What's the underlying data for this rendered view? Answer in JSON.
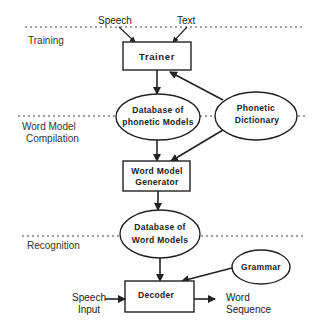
{
  "sections": [
    {
      "id": "training",
      "label": "Training"
    },
    {
      "id": "compilation",
      "lines": [
        "Word Model",
        "Compilation"
      ]
    },
    {
      "id": "recognition",
      "label": "Recognition"
    }
  ],
  "inputs": {
    "speech": "Speech",
    "text": "Text"
  },
  "nodes": {
    "trainer": {
      "label": "Trainer",
      "shape": "rectangle"
    },
    "phonetic_db": {
      "lines": [
        "Database of",
        "phonetic Models"
      ],
      "shape": "ellipse"
    },
    "phonetic_dict": {
      "lines": [
        "Phonetic",
        "Dictionary"
      ],
      "shape": "ellipse"
    },
    "generator": {
      "lines": [
        "Word Model",
        "Generator"
      ],
      "shape": "rectangle"
    },
    "word_db": {
      "lines": [
        "Database of",
        "Word Models"
      ],
      "shape": "ellipse"
    },
    "grammar": {
      "label": "Grammar",
      "shape": "ellipse"
    },
    "decoder": {
      "label": "Decoder",
      "shape": "rectangle"
    }
  },
  "io": {
    "speech_input": [
      "Speech",
      "Input"
    ],
    "word_sequence": [
      "Word",
      "Sequence"
    ]
  },
  "edges": [
    {
      "from": "Speech",
      "to": "Trainer"
    },
    {
      "from": "Text",
      "to": "Trainer"
    },
    {
      "from": "Trainer",
      "to": "Database of phonetic Models"
    },
    {
      "from": "Phonetic Dictionary",
      "to": "Trainer"
    },
    {
      "from": "Database of phonetic Models",
      "to": "Word Model Generator"
    },
    {
      "from": "Phonetic Dictionary",
      "to": "Word Model Generator"
    },
    {
      "from": "Word Model Generator",
      "to": "Database of Word Models"
    },
    {
      "from": "Database of Word Models",
      "to": "Decoder"
    },
    {
      "from": "Grammar",
      "to": "Decoder"
    },
    {
      "from": "Speech Input",
      "to": "Decoder"
    },
    {
      "from": "Decoder",
      "to": "Word Sequence"
    }
  ]
}
